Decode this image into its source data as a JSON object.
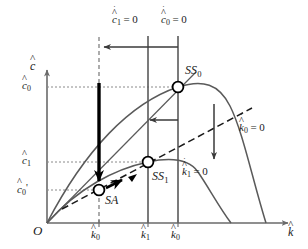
{
  "figure": {
    "kind": "phase-diagram",
    "background_color": "#ffffff",
    "line_color": "#4d4d4d",
    "text_color": "#1a1a1a",
    "accent_color": "#000000"
  },
  "axes": {
    "y_label": "c",
    "y_label_accent": "hat",
    "x_label": "k",
    "x_label_accent": "hat",
    "origin_label": "O",
    "x_range": [
      0,
      308
    ],
    "y_range": [
      0,
      249
    ],
    "grid": "dotted-guides"
  },
  "y_ticks": [
    {
      "id": "c0",
      "base": "c",
      "sub": "0",
      "prime": false,
      "text": "c̅0",
      "y_px": 87
    },
    {
      "id": "c1",
      "base": "c",
      "sub": "1",
      "prime": false,
      "text": "c̅1",
      "y_px": 162
    },
    {
      "id": "c0_prime",
      "base": "c",
      "sub": "0",
      "prime": true,
      "text": "c̅0'",
      "y_px": 190
    }
  ],
  "x_ticks": [
    {
      "id": "k0_prime",
      "base": "k",
      "sub": "0",
      "prime": true,
      "text": "k̅0'",
      "x_px": 99
    },
    {
      "id": "k1",
      "base": "k",
      "sub": "1",
      "prime": false,
      "text": "k̅1",
      "x_px": 148
    },
    {
      "id": "k0",
      "base": "k",
      "sub": "0",
      "prime": false,
      "text": "k̅0",
      "x_px": 178
    }
  ],
  "loci": [
    {
      "id": "cdot1-zero",
      "label": "ċ̅1 = 0",
      "base": "c",
      "sub": "1",
      "equals": "= 0",
      "type": "vertical-line",
      "style": "solid",
      "x_px": 148,
      "label_x_px": 112,
      "label_y_px": 12
    },
    {
      "id": "cdot0-zero",
      "label": "ċ̅0 = 0",
      "base": "c",
      "sub": "0",
      "equals": "= 0",
      "type": "vertical-line",
      "style": "solid",
      "x_px": 178,
      "label_x_px": 161,
      "label_y_px": 12
    },
    {
      "id": "kdot0-zero",
      "label": "k̇̅0 = 0",
      "base": "k",
      "sub": "0",
      "equals": "= 0",
      "type": "curve",
      "style": "solid",
      "label_x_px": 239,
      "label_y_px": 121
    },
    {
      "id": "kdot1-zero",
      "label": "k̇̅1 = 0",
      "base": "k",
      "sub": "1",
      "equals": "= 0",
      "type": "curve",
      "style": "solid",
      "label_x_px": 182,
      "label_y_px": 165
    },
    {
      "id": "new-k0-prime-guide",
      "label": "",
      "type": "vertical-line",
      "style": "dashed",
      "x_px": 99
    }
  ],
  "points": [
    {
      "id": "SS0",
      "label": "SS",
      "sub": "0",
      "text": "SS0",
      "x_px": 178,
      "y_px": 87,
      "marker": "open-circle"
    },
    {
      "id": "SS1",
      "label": "SS",
      "sub": "1",
      "text": "SS1",
      "x_px": 148,
      "y_px": 162,
      "marker": "open-circle"
    },
    {
      "id": "SA",
      "label": "SA",
      "sub": "",
      "text": "SA",
      "x_px": 99,
      "y_px": 190,
      "marker": "open-circle"
    }
  ],
  "point_labels": [
    {
      "for": "SS0",
      "x_px": 185,
      "y_px": 70
    },
    {
      "for": "SS1",
      "x_px": 153,
      "y_px": 172
    },
    {
      "for": "SA",
      "x_px": 104,
      "y_px": 196
    }
  ],
  "arrows": [
    {
      "id": "top-shift-arrow",
      "direction": "left",
      "weight": "thin",
      "from_x": 178,
      "from_y": 47,
      "to_x": 100,
      "to_y": 47
    },
    {
      "id": "middle-shift-arrow",
      "direction": "left",
      "weight": "thin",
      "from_x": 178,
      "from_y": 120,
      "to_x": 145,
      "to_y": 120
    },
    {
      "id": "right-drop-arrow",
      "direction": "down",
      "weight": "thin",
      "from_x": 214,
      "from_y": 105,
      "to_x": 214,
      "to_y": 163
    },
    {
      "id": "jump-down-arrow",
      "direction": "down",
      "weight": "thick",
      "from_x": 99,
      "from_y": 84,
      "to_x": 99,
      "to_y": 188
    },
    {
      "id": "saddle-path-arrow",
      "direction": "up-right",
      "weight": "thick",
      "from_x": 106,
      "from_y": 187,
      "to_x": 125,
      "to_y": 178
    }
  ],
  "curves": {
    "saddle_path": {
      "style": "dashed",
      "from": "origin-lower-left",
      "to": "upper-right"
    },
    "ray_to_SS0": {
      "style": "solid"
    }
  }
}
